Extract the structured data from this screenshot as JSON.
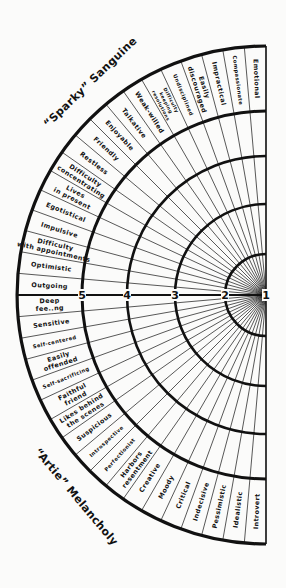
{
  "diagram": {
    "type": "temperament-semicircle",
    "center": {
      "x": 266,
      "y": 295
    },
    "outer_radius": 249,
    "band_inner_radius": 184,
    "ring_radii": [
      139,
      91,
      41
    ],
    "stroke_color": "#111111",
    "background": "#fbfbfa"
  },
  "titles": {
    "top": "“Sparky” Sanguine",
    "bottom": "“Artie” Melancholy"
  },
  "scale_labels": [
    "5",
    "4",
    "3",
    "2",
    "1"
  ],
  "sanguine_traits": [
    "Emotional",
    "Compassionate",
    "Impractical",
    "Easily discouraged",
    "Undisciplined",
    "Difficulty keeping resolutions",
    "Weak-willed",
    "Talkative",
    "Enjoyable",
    "Friendly",
    "Restless",
    "Difficulty concentrating",
    "Lives in present",
    "Egotistical",
    "Impulsive",
    "Difficulty with appointments",
    "Optimistic",
    "Outgoing"
  ],
  "melancholy_traits": [
    "Deep fee..ng",
    "Sensitive",
    "Self-centered",
    "Easily offended",
    "Self-sacrificing",
    "Faithful friend",
    "Likes behind the scenes",
    "Suspicious",
    "Introspective",
    "Perfectionist",
    "Harbors resentment",
    "Creative",
    "Moody",
    "Critical",
    "Indecisive",
    "Pessimistic",
    "Idealistic",
    "Introvert"
  ]
}
